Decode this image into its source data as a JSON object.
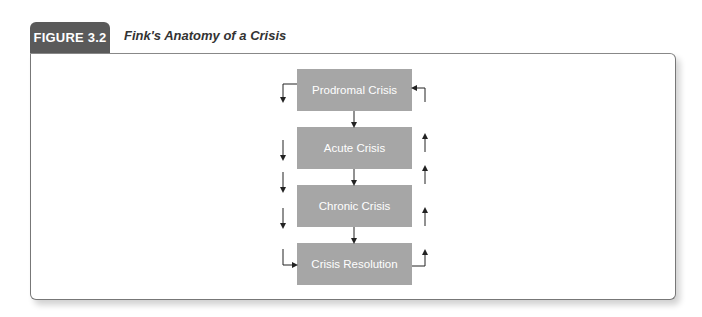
{
  "figure": {
    "label": "FIGURE 3.2",
    "title": "Fink's Anatomy of a Crisis"
  },
  "diagram": {
    "stages": [
      {
        "label": "Prodromal Crisis"
      },
      {
        "label": "Acute Crisis"
      },
      {
        "label": "Chronic Crisis"
      },
      {
        "label": "Crisis Resolution"
      }
    ],
    "flow": "sequential downward with left-side downward arrows and right-side upward feedback loop from Crisis Resolution back to Prodromal Crisis"
  },
  "colors": {
    "tab_bg": "#5a5a5a",
    "box_bg": "#a6a6a6",
    "arrow": "#222222"
  }
}
